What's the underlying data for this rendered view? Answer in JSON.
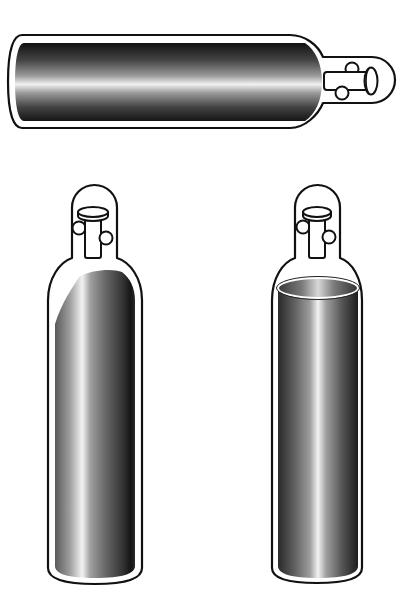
{
  "figure": {
    "background": "#ffffff",
    "outline_color": "#111111",
    "shade_dark": "#111111",
    "shade_mid": "#6a6a6a",
    "shade_light": "#f2f2f2",
    "cylinders": [
      {
        "id": "top",
        "orientation": "horizontal",
        "position": "top",
        "fill_style": "full",
        "valve": "right"
      },
      {
        "id": "bottom-left",
        "orientation": "vertical",
        "position": "bottom-left",
        "fill_style": "diagonal-top",
        "valve": "top"
      },
      {
        "id": "bottom-right",
        "orientation": "vertical",
        "position": "bottom-right",
        "fill_style": "liquid-level",
        "valve": "top"
      }
    ]
  }
}
